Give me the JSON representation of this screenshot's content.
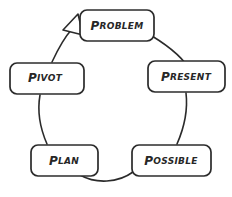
{
  "diagram": {
    "type": "cycle-diagram",
    "direction": "counterclockwise",
    "ink_color": "#272727",
    "background_color": "#ffffff",
    "nodes": [
      {
        "id": "problem",
        "label": "Problem",
        "cap": "P",
        "rest": "ROBLEM",
        "position": "top",
        "box": {
          "x": 80,
          "y": 10,
          "w": 74,
          "h": 31
        }
      },
      {
        "id": "present",
        "label": "Present",
        "cap": "P",
        "rest": "RESENT",
        "position": "right",
        "box": {
          "x": 148,
          "y": 61,
          "w": 77,
          "h": 31
        }
      },
      {
        "id": "possible",
        "label": "Possible",
        "cap": "P",
        "rest": "OSSIBLE",
        "position": "bottom-right",
        "box": {
          "x": 132,
          "y": 145,
          "w": 79,
          "h": 31
        }
      },
      {
        "id": "plan",
        "label": "Plan",
        "cap": "P",
        "rest": "LAN",
        "position": "bottom-left",
        "box": {
          "x": 31,
          "y": 145,
          "w": 67,
          "h": 31
        }
      },
      {
        "id": "pivot",
        "label": "Pivot",
        "cap": "P",
        "rest": "IVOT",
        "position": "left",
        "box": {
          "x": 10,
          "y": 63,
          "w": 74,
          "h": 31
        }
      }
    ],
    "arrow": {
      "name": "cycle-arrowhead",
      "style": "hollow-triangle",
      "points_to": "problem",
      "x": 72,
      "y": 22
    },
    "connector": {
      "name": "cycle-ring",
      "style": "hand-drawn-circle",
      "center_x": 117,
      "center_y": 100,
      "radius_x": 82,
      "radius_y": 78
    }
  }
}
